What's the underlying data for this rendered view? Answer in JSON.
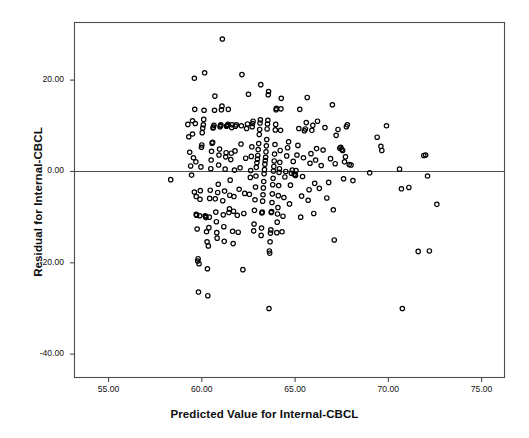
{
  "chart_data": {
    "type": "scatter",
    "title": "",
    "xlabel": "Predicted Value for Internal-CBCL",
    "ylabel": "Residual for Internal-CBCL",
    "xlim": [
      53.2,
      76.2
    ],
    "ylim": [
      -45.0,
      32.5
    ],
    "xticks": [
      55,
      60,
      65,
      70,
      75
    ],
    "yticks": [
      20,
      0,
      -20,
      -40
    ],
    "xtick_labels": [
      "55.00",
      "60.00",
      "65.00",
      "70.00",
      "75.00"
    ],
    "ytick_labels": [
      "20.00",
      "0.00",
      "-20.00",
      "-40.00"
    ],
    "grid": false,
    "legend": false,
    "reference_line": {
      "axis": "y",
      "value": 0,
      "color": "#4d4d4d"
    },
    "marker": {
      "shape": "circle-open",
      "size": 4.4,
      "color": "#000000",
      "stroke_width": 1.2
    },
    "frame_color": "#4d4d4d",
    "background": "#ffffff",
    "n_points": 288,
    "points": [
      [
        58.33,
        -1.8
      ],
      [
        59.25,
        10.3
      ],
      [
        59.3,
        7.6
      ],
      [
        59.35,
        4.2
      ],
      [
        59.4,
        1.2
      ],
      [
        59.45,
        -0.8
      ],
      [
        59.5,
        11.1
      ],
      [
        59.5,
        8.2
      ],
      [
        59.55,
        3.0
      ],
      [
        59.6,
        -4.5
      ],
      [
        59.6,
        20.4
      ],
      [
        59.62,
        13.6
      ],
      [
        59.65,
        10.5
      ],
      [
        59.68,
        2.1
      ],
      [
        59.7,
        -5.5
      ],
      [
        59.7,
        -9.4
      ],
      [
        59.72,
        -9.6
      ],
      [
        59.75,
        -12.6
      ],
      [
        59.78,
        -19.6
      ],
      [
        59.8,
        -19.1
      ],
      [
        59.82,
        -26.4
      ],
      [
        59.85,
        -20.2
      ],
      [
        59.88,
        -9.7
      ],
      [
        59.9,
        -6.1
      ],
      [
        59.92,
        -4.2
      ],
      [
        59.95,
        1.0
      ],
      [
        59.98,
        5.3
      ],
      [
        60.0,
        5.8
      ],
      [
        60.02,
        8.5
      ],
      [
        60.05,
        9.5
      ],
      [
        60.08,
        10.2
      ],
      [
        60.1,
        11.4
      ],
      [
        60.12,
        13.4
      ],
      [
        60.15,
        21.6
      ],
      [
        60.18,
        -9.7
      ],
      [
        60.2,
        -9.9
      ],
      [
        60.22,
        -10.1
      ],
      [
        60.25,
        -13.2
      ],
      [
        60.28,
        -15.4
      ],
      [
        60.3,
        -21.3
      ],
      [
        60.32,
        -27.2
      ],
      [
        60.35,
        -16.3
      ],
      [
        60.38,
        -12.3
      ],
      [
        60.4,
        -10.0
      ],
      [
        60.42,
        -5.9
      ],
      [
        60.45,
        -4.1
      ],
      [
        60.48,
        0.6
      ],
      [
        60.5,
        2.5
      ],
      [
        60.52,
        4.4
      ],
      [
        60.55,
        6.2
      ],
      [
        60.58,
        6.4
      ],
      [
        60.6,
        9.5
      ],
      [
        60.62,
        9.7
      ],
      [
        60.65,
        10.1
      ],
      [
        60.68,
        13.4
      ],
      [
        60.7,
        16.5
      ],
      [
        60.72,
        -6.0
      ],
      [
        60.75,
        -8.9
      ],
      [
        60.78,
        -11.0
      ],
      [
        60.8,
        -13.4
      ],
      [
        60.82,
        -14.6
      ],
      [
        60.85,
        -4.6
      ],
      [
        60.88,
        -2.8
      ],
      [
        60.9,
        1.4
      ],
      [
        60.92,
        3.6
      ],
      [
        60.95,
        4.9
      ],
      [
        60.98,
        9.8
      ],
      [
        61.0,
        10.0
      ],
      [
        61.02,
        10.2
      ],
      [
        61.05,
        13.5
      ],
      [
        61.08,
        14.3
      ],
      [
        61.1,
        29.0
      ],
      [
        61.12,
        -6.4
      ],
      [
        61.15,
        -9.5
      ],
      [
        61.18,
        -12.1
      ],
      [
        61.2,
        -15.3
      ],
      [
        61.22,
        -4.3
      ],
      [
        61.25,
        0.5
      ],
      [
        61.28,
        3.2
      ],
      [
        61.3,
        4.1
      ],
      [
        61.32,
        9.9
      ],
      [
        61.35,
        10.0
      ],
      [
        61.38,
        10.1
      ],
      [
        61.4,
        10.3
      ],
      [
        61.42,
        13.6
      ],
      [
        61.45,
        -9.0
      ],
      [
        61.48,
        -8.2
      ],
      [
        61.5,
        -5.2
      ],
      [
        61.52,
        -1.9
      ],
      [
        61.55,
        2.6
      ],
      [
        61.58,
        4.0
      ],
      [
        61.6,
        9.6
      ],
      [
        61.62,
        10.2
      ],
      [
        61.65,
        -13.1
      ],
      [
        61.68,
        -15.8
      ],
      [
        61.7,
        -8.7
      ],
      [
        61.72,
        -5.5
      ],
      [
        61.75,
        0.3
      ],
      [
        61.78,
        4.5
      ],
      [
        61.8,
        9.9
      ],
      [
        61.85,
        10.2
      ],
      [
        61.9,
        -9.6
      ],
      [
        61.95,
        -13.3
      ],
      [
        62.0,
        -3.9
      ],
      [
        62.05,
        0.8
      ],
      [
        62.1,
        6.0
      ],
      [
        62.12,
        10.0
      ],
      [
        62.15,
        21.2
      ],
      [
        62.2,
        -21.5
      ],
      [
        62.25,
        -9.2
      ],
      [
        62.3,
        -4.8
      ],
      [
        62.35,
        2.9
      ],
      [
        62.4,
        9.4
      ],
      [
        62.45,
        10.4
      ],
      [
        62.5,
        16.9
      ],
      [
        62.55,
        -5.0
      ],
      [
        62.6,
        -1.3
      ],
      [
        62.62,
        0.2
      ],
      [
        62.65,
        3.3
      ],
      [
        62.68,
        5.4
      ],
      [
        62.7,
        9.8
      ],
      [
        62.72,
        10.5
      ],
      [
        62.75,
        11.0
      ],
      [
        62.78,
        -13.0
      ],
      [
        62.8,
        -11.5
      ],
      [
        62.82,
        -8.5
      ],
      [
        62.85,
        -6.2
      ],
      [
        62.88,
        -3.4
      ],
      [
        62.9,
        -1.0
      ],
      [
        62.92,
        0.9
      ],
      [
        62.95,
        1.9
      ],
      [
        62.98,
        2.7
      ],
      [
        63.0,
        3.5
      ],
      [
        63.02,
        4.8
      ],
      [
        63.05,
        6.1
      ],
      [
        63.08,
        8.1
      ],
      [
        63.1,
        9.2
      ],
      [
        63.12,
        10.6
      ],
      [
        63.14,
        11.3
      ],
      [
        63.16,
        19.0
      ],
      [
        63.18,
        -14.0
      ],
      [
        63.2,
        -12.4
      ],
      [
        63.22,
        -9.1
      ],
      [
        63.24,
        -8.9
      ],
      [
        63.26,
        -6.5
      ],
      [
        63.28,
        -5.1
      ],
      [
        63.3,
        -3.6
      ],
      [
        63.32,
        -2.2
      ],
      [
        63.34,
        -0.5
      ],
      [
        63.36,
        0.4
      ],
      [
        63.38,
        1.6
      ],
      [
        63.4,
        2.4
      ],
      [
        63.42,
        3.1
      ],
      [
        63.44,
        4.3
      ],
      [
        63.46,
        5.6
      ],
      [
        63.48,
        7.0
      ],
      [
        63.5,
        9.3
      ],
      [
        63.52,
        10.4
      ],
      [
        63.54,
        11.2
      ],
      [
        63.56,
        16.8
      ],
      [
        63.58,
        17.5
      ],
      [
        63.6,
        -30.0
      ],
      [
        63.62,
        -17.4
      ],
      [
        63.64,
        -17.9
      ],
      [
        63.66,
        -15.4
      ],
      [
        63.68,
        -13.5
      ],
      [
        63.7,
        -12.8
      ],
      [
        63.72,
        -9.0
      ],
      [
        63.74,
        -8.8
      ],
      [
        63.76,
        -6.8
      ],
      [
        63.78,
        -4.9
      ],
      [
        63.8,
        -2.9
      ],
      [
        63.82,
        -1.5
      ],
      [
        63.84,
        0.1
      ],
      [
        63.86,
        1.1
      ],
      [
        63.88,
        2.3
      ],
      [
        63.9,
        3.8
      ],
      [
        63.92,
        5.9
      ],
      [
        63.94,
        9.1
      ],
      [
        63.96,
        10.3
      ],
      [
        63.98,
        13.5
      ],
      [
        64.0,
        13.8
      ],
      [
        64.02,
        -13.4
      ],
      [
        64.04,
        -11.1
      ],
      [
        64.06,
        -9.3
      ],
      [
        64.08,
        -7.9
      ],
      [
        64.1,
        -5.3
      ],
      [
        64.12,
        -3.1
      ],
      [
        64.14,
        -0.2
      ],
      [
        64.16,
        0.6
      ],
      [
        64.18,
        2.0
      ],
      [
        64.2,
        4.6
      ],
      [
        64.22,
        9.0
      ],
      [
        64.24,
        13.7
      ],
      [
        64.26,
        16.0
      ],
      [
        64.3,
        -13.2
      ],
      [
        64.35,
        -9.8
      ],
      [
        64.4,
        -5.7
      ],
      [
        64.45,
        -1.2
      ],
      [
        64.5,
        0.0
      ],
      [
        64.55,
        3.4
      ],
      [
        64.6,
        5.2
      ],
      [
        64.65,
        6.5
      ],
      [
        64.7,
        -7.1
      ],
      [
        64.75,
        -3.0
      ],
      [
        64.8,
        -0.4
      ],
      [
        64.85,
        0.3
      ],
      [
        64.9,
        2.2
      ],
      [
        64.95,
        -0.6
      ],
      [
        65.0,
        -0.7
      ],
      [
        65.02,
        -0.9
      ],
      [
        65.05,
        0.2
      ],
      [
        65.1,
        3.6
      ],
      [
        65.15,
        5.7
      ],
      [
        65.2,
        9.4
      ],
      [
        65.25,
        13.6
      ],
      [
        65.3,
        -10.0
      ],
      [
        65.35,
        -5.4
      ],
      [
        65.4,
        -1.1
      ],
      [
        65.45,
        3.0
      ],
      [
        65.5,
        8.9
      ],
      [
        65.55,
        9.3
      ],
      [
        65.6,
        10.7
      ],
      [
        65.65,
        16.2
      ],
      [
        65.7,
        -6.3
      ],
      [
        65.75,
        -4.0
      ],
      [
        65.8,
        1.8
      ],
      [
        65.85,
        3.9
      ],
      [
        65.9,
        9.0
      ],
      [
        65.95,
        10.1
      ],
      [
        66.0,
        -9.2
      ],
      [
        66.05,
        -2.6
      ],
      [
        66.1,
        2.5
      ],
      [
        66.15,
        5.0
      ],
      [
        66.2,
        11.0
      ],
      [
        66.3,
        -3.7
      ],
      [
        66.4,
        1.3
      ],
      [
        66.5,
        4.7
      ],
      [
        66.6,
        9.6
      ],
      [
        66.7,
        -5.8
      ],
      [
        66.8,
        -2.4
      ],
      [
        66.9,
        2.8
      ],
      [
        67.0,
        14.6
      ],
      [
        67.05,
        -8.4
      ],
      [
        67.1,
        -15.0
      ],
      [
        67.15,
        1.7
      ],
      [
        67.2,
        7.9
      ],
      [
        67.3,
        9.2
      ],
      [
        67.4,
        5.1
      ],
      [
        67.45,
        5.3
      ],
      [
        67.5,
        4.8
      ],
      [
        67.55,
        4.6
      ],
      [
        67.6,
        -1.6
      ],
      [
        67.65,
        2.1
      ],
      [
        67.7,
        3.2
      ],
      [
        67.75,
        9.8
      ],
      [
        67.8,
        10.2
      ],
      [
        67.9,
        1.5
      ],
      [
        68.0,
        1.4
      ],
      [
        68.1,
        -2.0
      ],
      [
        69.0,
        -0.3
      ],
      [
        69.4,
        7.5
      ],
      [
        69.6,
        5.5
      ],
      [
        69.65,
        4.6
      ],
      [
        69.9,
        10.0
      ],
      [
        70.6,
        0.5
      ],
      [
        70.7,
        -3.8
      ],
      [
        70.75,
        -30.0
      ],
      [
        71.1,
        -3.5
      ],
      [
        71.6,
        -17.5
      ],
      [
        71.9,
        3.5
      ],
      [
        72.0,
        3.6
      ],
      [
        72.1,
        -1.0
      ],
      [
        72.2,
        -17.4
      ],
      [
        72.6,
        -7.2
      ]
    ]
  }
}
